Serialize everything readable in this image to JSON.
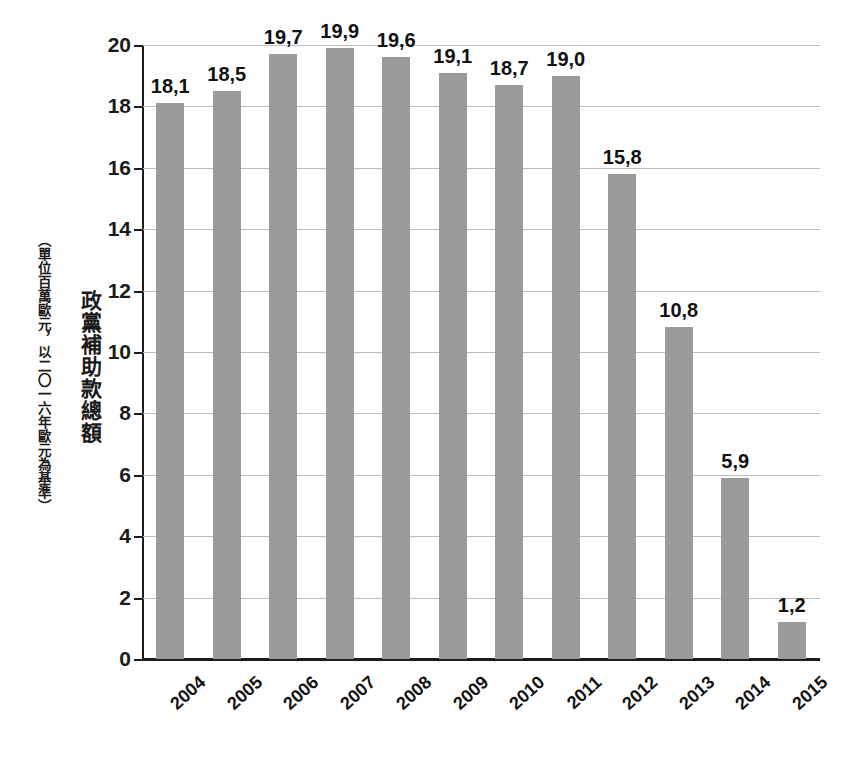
{
  "chart_data": {
    "type": "bar",
    "title": "",
    "subtitle": "",
    "xlabel": "",
    "ylabel": "政黨補助款總額",
    "ylabel_note": "（單位百萬歐元，以二〇一六年歐元為基準）",
    "categories": [
      "2004",
      "2005",
      "2006",
      "2007",
      "2008",
      "2009",
      "2010",
      "2011",
      "2012",
      "2013",
      "2014",
      "2015"
    ],
    "values": [
      18.1,
      18.5,
      19.7,
      19.9,
      19.6,
      19.1,
      18.7,
      19.0,
      15.8,
      10.8,
      5.9,
      1.2
    ],
    "value_labels": [
      "18,1",
      "18,5",
      "19,7",
      "19,9",
      "19,6",
      "19,1",
      "18,7",
      "19,0",
      "15,8",
      "10,8",
      "5,9",
      "1,2"
    ],
    "ylim": [
      0,
      20
    ],
    "ytick_values": [
      0,
      2,
      4,
      6,
      8,
      10,
      12,
      14,
      16,
      18,
      20
    ],
    "ytick_labels": [
      "0",
      "2",
      "4",
      "6",
      "8",
      "10",
      "12",
      "14",
      "16",
      "18",
      "20"
    ],
    "grid": true,
    "legend": false,
    "legend_position": "none",
    "bar_color": "#9a9a9a",
    "axis_color": "#1c1c1c",
    "gridline_color": "#bdbdbd",
    "background_color": "#ffffff",
    "xtick_rotation_deg": -42,
    "decimal_separator": ","
  }
}
